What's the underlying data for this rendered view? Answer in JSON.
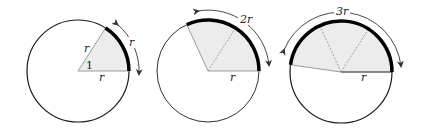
{
  "figure": {
    "colors": {
      "circle": "#1a1a1a",
      "arc": "#000000",
      "sector_fill": "#ececec",
      "radius_line": "#9a9a9a",
      "dashed": "#8a8a8a",
      "arrow": "#333333"
    },
    "panels": [
      {
        "id": "one-radian",
        "arc_label": "r",
        "radius_label_side": "r",
        "radius_label_base": "r",
        "angle_label": "1",
        "radians": 1
      },
      {
        "id": "two-radians",
        "arc_label": "2r",
        "radius_label_base": "r",
        "radians": 2
      },
      {
        "id": "three-radians",
        "arc_label": "3r",
        "radius_label_base": "r",
        "radians": 3
      }
    ]
  }
}
